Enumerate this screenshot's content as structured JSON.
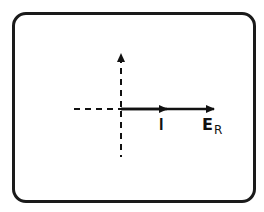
{
  "diagram": {
    "type": "phasor-diagram",
    "frame": {
      "shape": "rounded-rectangle",
      "stroke_color": "#1a1a1a"
    },
    "axes": {
      "horizontal_reference": "dashed",
      "vertical_reference": "dashed",
      "vertical_arrow": "up"
    },
    "phasors": [
      {
        "name": "I",
        "label": "I",
        "direction": "right",
        "phase_deg": 0,
        "relative_length": 1.0
      },
      {
        "name": "E_R",
        "label_main": "E",
        "label_sub": "R",
        "direction": "right",
        "phase_deg": 0,
        "relative_length": 2.0
      }
    ],
    "colors": {
      "ink": "#111111",
      "background": "#ffffff"
    }
  }
}
